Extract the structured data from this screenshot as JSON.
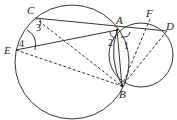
{
  "diagram": {
    "type": "geometry",
    "circles": [
      {
        "name": "large-circle",
        "cx": 72,
        "cy": 62,
        "r": 57
      },
      {
        "name": "small-circle",
        "cx": 141,
        "cy": 55,
        "r": 32
      }
    ],
    "points": {
      "A": {
        "label": "A",
        "x": 117,
        "y": 30
      },
      "B": {
        "label": "B",
        "x": 122,
        "y": 86
      },
      "C": {
        "label": "C",
        "x": 35,
        "y": 18
      },
      "D": {
        "label": "D",
        "x": 167,
        "y": 31
      },
      "E": {
        "label": "E",
        "x": 16,
        "y": 50
      },
      "F": {
        "label": "F",
        "x": 150,
        "y": 19
      }
    },
    "angle_labels": {
      "one": "1",
      "two": "2",
      "three": "3",
      "four": "4"
    },
    "solid_segments": [
      "C-D",
      "E-A",
      "A-B"
    ],
    "dashed_segments": [
      "C-B",
      "E-B",
      "F-B",
      "D-B"
    ]
  }
}
